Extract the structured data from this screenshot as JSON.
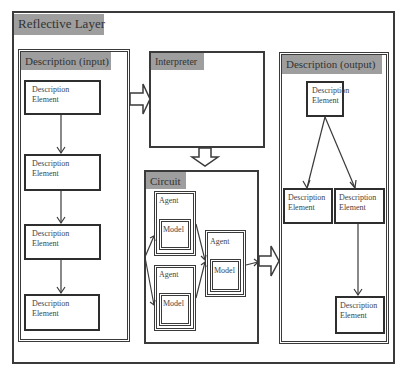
{
  "diagram": {
    "title": "Reflective Layer",
    "panels": {
      "input": {
        "label": "Description (input)",
        "elements": [
          {
            "line1": "Description",
            "line2": "Element"
          },
          {
            "line1": "Description",
            "line2": "Element"
          },
          {
            "line1": "Description",
            "line2": "Element"
          },
          {
            "line1": "Description",
            "line2": "Element"
          }
        ]
      },
      "interpreter": {
        "label": "Interpreter"
      },
      "circuit": {
        "label": "Circuit",
        "agents": [
          {
            "label": "Agent",
            "model": "Model"
          },
          {
            "label": "Agent",
            "model": "Model"
          },
          {
            "label": "Agent",
            "model": "Model"
          }
        ]
      },
      "output": {
        "label": "Description (output)",
        "elements": [
          {
            "line1": "Description",
            "line2": "Element"
          },
          {
            "line1": "Description",
            "line2": "Element"
          },
          {
            "line1": "Description",
            "line2": "Element"
          },
          {
            "line1": "Description",
            "line2": "Element"
          }
        ]
      }
    },
    "colors": {
      "header_fill": "#9e9e9e",
      "border": "#3a3a3a",
      "background": "#ffffff"
    }
  }
}
